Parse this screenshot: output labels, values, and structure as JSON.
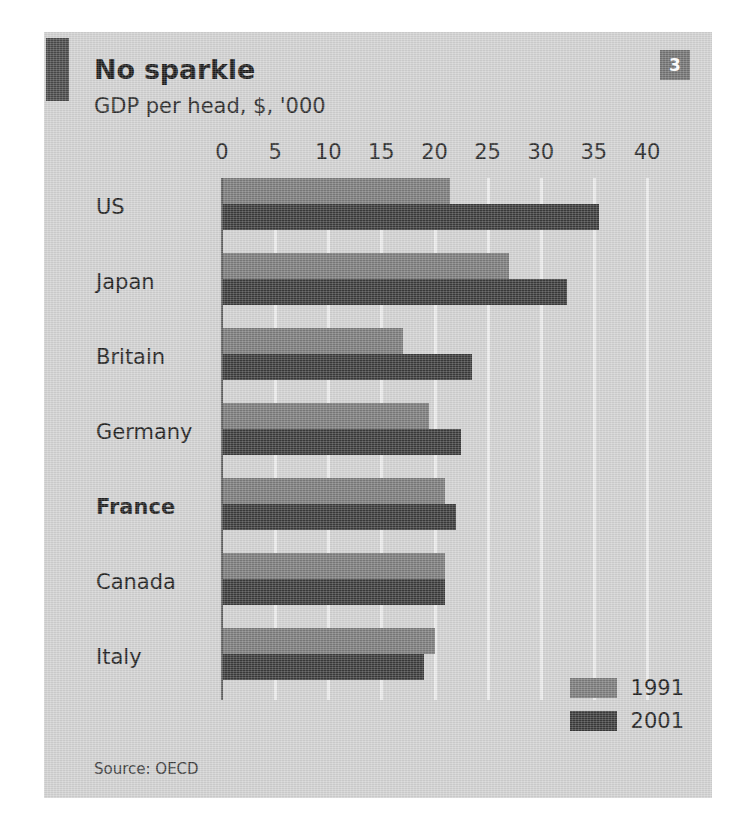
{
  "panel": {
    "number_badge": "3",
    "title": "No sparkle",
    "subtitle": "GDP per head, $, '000",
    "source": "Source: OECD"
  },
  "colors": {
    "panel_background": "#d2d2d2",
    "accent_bar": "#4a4a4a",
    "badge": "#737373",
    "series_1991": "#7c7c7c",
    "series_2001": "#3b3b3b",
    "gridline": "#ececec",
    "zero_line": "#5d5d5d",
    "text": "#1f1f1f"
  },
  "chart_data": {
    "type": "bar",
    "orientation": "horizontal",
    "title": "No sparkle",
    "subtitle": "GDP per head, $, '000",
    "xlabel": "",
    "ylabel": "",
    "xlim": [
      0,
      40
    ],
    "xticks": [
      0,
      5,
      10,
      15,
      20,
      25,
      30,
      35,
      40
    ],
    "xtick_labels": [
      "0",
      "5",
      "10",
      "15",
      "20",
      "25",
      "30",
      "35",
      "40"
    ],
    "grid": true,
    "grid_axis": "x",
    "legend_position": "bottom-right",
    "categories": [
      "US",
      "Japan",
      "Britain",
      "Germany",
      "France",
      "Canada",
      "Italy"
    ],
    "emphasised_category": "France",
    "series": [
      {
        "name": "1991",
        "color": "#7c7c7c",
        "values": [
          21.5,
          27.0,
          17.0,
          19.5,
          21.0,
          21.0,
          20.0
        ]
      },
      {
        "name": "2001",
        "color": "#3b3b3b",
        "values": [
          35.5,
          32.5,
          23.5,
          22.5,
          22.0,
          21.0,
          19.0
        ]
      }
    ],
    "source": "Source: OECD"
  }
}
